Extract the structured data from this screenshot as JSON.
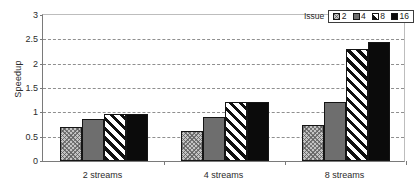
{
  "chart_data": {
    "type": "bar",
    "title": "",
    "xlabel": "",
    "ylabel": "Speedup",
    "ylim": [
      0,
      3
    ],
    "yticks": [
      "0",
      "0.5",
      "1",
      "1.5",
      "2",
      "2.5",
      "3"
    ],
    "ytick_values": [
      0,
      0.5,
      1,
      1.5,
      2,
      2.5,
      3
    ],
    "grid": true,
    "grid_style": "dashed horizontal",
    "legend_title": "Issue",
    "legend_position": "top-right",
    "categories": [
      "2 streams",
      "4 streams",
      "8 streams"
    ],
    "series": [
      {
        "name": "2",
        "values": [
          0.68,
          0.6,
          0.73
        ],
        "fill": "checkered-light-gray",
        "color": "#c4c4c4"
      },
      {
        "name": "4",
        "values": [
          0.86,
          0.9,
          1.2
        ],
        "fill": "solid-dark-gray",
        "color": "#6e6e6e"
      },
      {
        "name": "8",
        "values": [
          0.95,
          1.2,
          2.28
        ],
        "fill": "diagonal-hatch",
        "color": "#ffffff"
      },
      {
        "name": "16",
        "values": [
          0.96,
          1.2,
          2.42
        ],
        "fill": "solid-black",
        "color": "#0b0b0b"
      }
    ]
  },
  "axis": {
    "y_title": "Speedup"
  },
  "legend": {
    "title": "Issue",
    "entries": [
      {
        "label": "2"
      },
      {
        "label": "4"
      },
      {
        "label": "8"
      },
      {
        "label": "16"
      }
    ]
  }
}
